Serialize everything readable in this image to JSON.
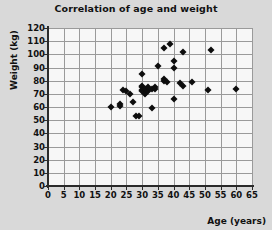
{
  "chart_data": {
    "type": "scatter",
    "title": "Correlation of age and weight",
    "xlabel": "Age (years)",
    "ylabel": "Weight (kg)",
    "xlim": [
      0,
      65
    ],
    "ylim": [
      0,
      120
    ],
    "xticks": [
      0,
      5,
      10,
      15,
      20,
      25,
      30,
      35,
      40,
      45,
      50,
      55,
      60,
      65
    ],
    "yticks": [
      0,
      10,
      20,
      30,
      40,
      50,
      60,
      70,
      80,
      90,
      100,
      110,
      120
    ],
    "grid": true,
    "legend": null,
    "marker": "diamond",
    "marker_color": "#0d0d0d",
    "series": [
      {
        "name": "Age vs Weight",
        "points": [
          [
            20,
            60
          ],
          [
            23,
            62
          ],
          [
            23,
            61
          ],
          [
            24,
            73
          ],
          [
            25,
            72
          ],
          [
            26,
            70
          ],
          [
            27,
            64
          ],
          [
            28,
            53
          ],
          [
            29,
            53
          ],
          [
            30,
            85
          ],
          [
            30,
            76
          ],
          [
            30,
            75
          ],
          [
            30,
            73
          ],
          [
            30,
            72
          ],
          [
            31,
            71
          ],
          [
            31,
            74
          ],
          [
            31,
            70
          ],
          [
            32,
            72
          ],
          [
            32,
            75
          ],
          [
            33,
            74
          ],
          [
            33,
            59
          ],
          [
            34,
            75
          ],
          [
            34,
            74
          ],
          [
            35,
            91
          ],
          [
            37,
            105
          ],
          [
            37,
            80
          ],
          [
            37,
            81
          ],
          [
            38,
            79
          ],
          [
            39,
            108
          ],
          [
            40,
            95
          ],
          [
            40,
            90
          ],
          [
            40,
            66
          ],
          [
            42,
            78
          ],
          [
            43,
            102
          ],
          [
            43,
            76
          ],
          [
            46,
            79
          ],
          [
            51,
            73
          ],
          [
            52,
            103
          ],
          [
            60,
            74
          ]
        ]
      }
    ]
  }
}
